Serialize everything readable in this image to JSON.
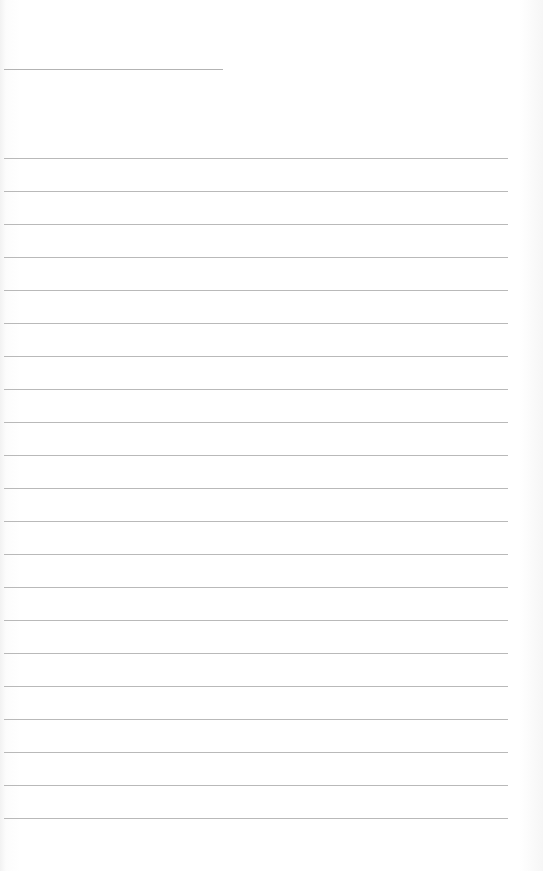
{
  "document": {
    "type": "lined-paper",
    "header_line": {
      "y": 69,
      "x_start": 4,
      "x_end": 223
    },
    "ruled_lines": {
      "count": 21,
      "first_y": 158,
      "spacing": 33,
      "x_start": 4,
      "x_end": 508
    },
    "colors": {
      "paper": "#ffffff",
      "line": "#b9b9b9"
    }
  }
}
